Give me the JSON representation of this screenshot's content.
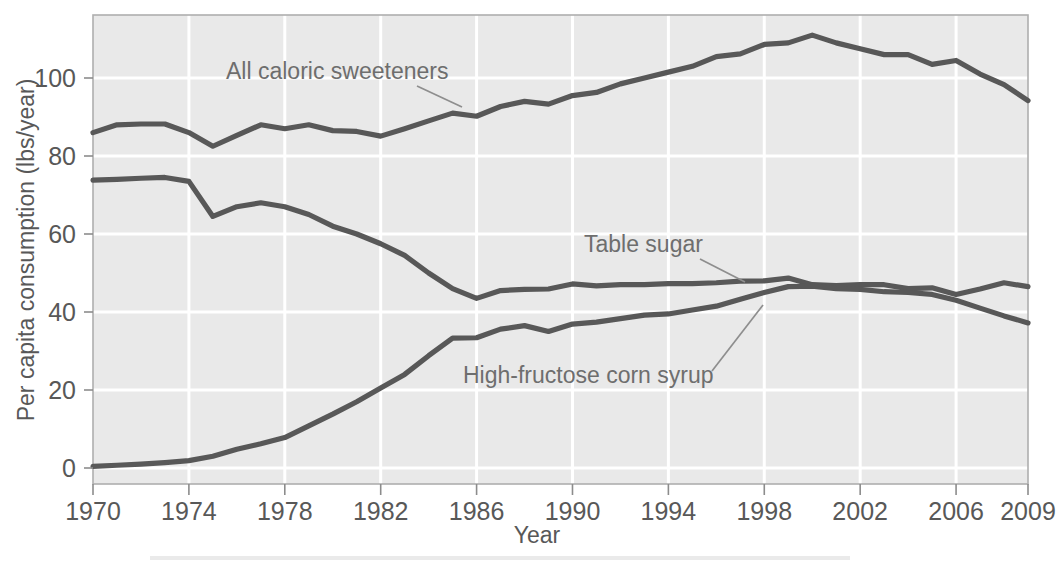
{
  "chart_data": {
    "type": "line",
    "title": "",
    "xlabel": "Year",
    "ylabel": "Per capita consumption (lbs/year)",
    "xlim": [
      1970,
      2009
    ],
    "ylim": [
      0,
      115
    ],
    "grid": true,
    "legend_position": "inline-annotations",
    "x_ticks": [
      "1970",
      "1974",
      "1978",
      "1982",
      "1986",
      "1990",
      "1994",
      "1998",
      "2002",
      "2006",
      "2009"
    ],
    "x_tick_values": [
      1970,
      1974,
      1978,
      1982,
      1986,
      1990,
      1994,
      1998,
      2002,
      2006,
      2009
    ],
    "y_ticks": [
      "0",
      "20",
      "40",
      "60",
      "80",
      "100"
    ],
    "y_tick_values": [
      0,
      20,
      40,
      60,
      80,
      100
    ],
    "x": [
      1970,
      1971,
      1972,
      1973,
      1974,
      1975,
      1976,
      1977,
      1978,
      1979,
      1980,
      1981,
      1982,
      1983,
      1984,
      1985,
      1986,
      1987,
      1988,
      1989,
      1990,
      1991,
      1992,
      1993,
      1994,
      1995,
      1996,
      1997,
      1998,
      1999,
      2000,
      2001,
      2002,
      2003,
      2004,
      2005,
      2006,
      2007,
      2008,
      2009
    ],
    "series": [
      {
        "name": "All caloric sweeteners",
        "color": "#585858",
        "values": [
          86.0,
          88.0,
          88.2,
          88.2,
          86.0,
          82.5,
          85.3,
          88.0,
          87.0,
          88.0,
          86.5,
          86.3,
          85.1,
          87.0,
          89.0,
          91.0,
          90.2,
          92.7,
          94.0,
          93.3,
          95.5,
          96.3,
          98.5,
          100.0,
          101.5,
          103.0,
          105.5,
          106.2,
          108.6,
          109.0,
          111.0,
          109.0,
          107.5,
          106.0,
          106.0,
          103.5,
          104.5,
          101.0,
          98.3,
          94.2
        ]
      },
      {
        "name": "Table sugar",
        "color": "#585858",
        "values": [
          73.8,
          74.0,
          74.3,
          74.5,
          73.5,
          64.5,
          67.0,
          68.0,
          67.0,
          65.0,
          62.0,
          60.0,
          57.5,
          54.5,
          50.0,
          46.0,
          43.5,
          45.5,
          45.8,
          45.9,
          47.2,
          46.7,
          47.0,
          47.0,
          47.3,
          47.3,
          47.5,
          47.9,
          48.0,
          48.7,
          47.0,
          46.8,
          47.0,
          47.0,
          46.0,
          46.2,
          44.5,
          45.9,
          47.5,
          46.5
        ]
      },
      {
        "name": "High-fructose corn syrup",
        "color": "#585858",
        "values": [
          0.4,
          0.7,
          1.0,
          1.4,
          1.9,
          3.0,
          4.8,
          6.2,
          7.8,
          10.8,
          13.8,
          17.0,
          20.5,
          24.0,
          28.8,
          33.3,
          33.4,
          35.6,
          36.5,
          35.0,
          36.9,
          37.4,
          38.3,
          39.2,
          39.5,
          40.5,
          41.5,
          43.3,
          45.0,
          46.5,
          46.6,
          46.0,
          45.8,
          45.2,
          45.0,
          44.5,
          43.0,
          41.0,
          39.0,
          37.2
        ]
      }
    ],
    "annotations": [
      {
        "label": "All caloric sweeteners"
      },
      {
        "label": "Table sugar"
      },
      {
        "label": "High-fructose corn syrup"
      }
    ]
  },
  "style": {
    "plot_background": "#e9e9e9",
    "gridline_color": "#ffffff",
    "line_color": "#585858",
    "text_color": "#585858",
    "page_background": "#ffffff"
  }
}
